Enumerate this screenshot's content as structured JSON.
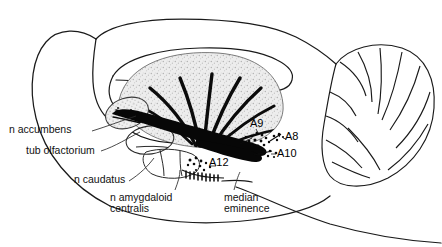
{
  "figure": {
    "background": "#ffffff",
    "ink": "#111111",
    "fiber_color": "#000000",
    "nucleus_fill": "#e9e9e9",
    "width": 442,
    "height": 247
  },
  "labels": {
    "accumbens": "n accumbens",
    "tub_olfactorium": "tub olfactorium",
    "caudatus": "n caudatus",
    "amygdaloid_line1": "n amygdaloid",
    "amygdaloid_line2": "centralis",
    "median_line1": "median",
    "median_line2": "eminence"
  },
  "cell_groups": {
    "a9": "A9",
    "a8": "A8",
    "a10": "A10",
    "a12": "A12"
  }
}
